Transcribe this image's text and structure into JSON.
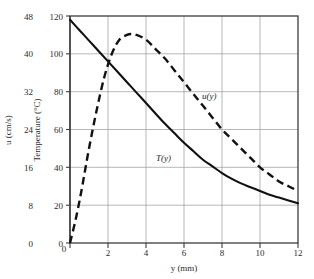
{
  "chart_data": {
    "type": "line",
    "title": "",
    "xlabel": "y (mm)",
    "xlim": [
      0,
      12
    ],
    "xticks": [
      0,
      2,
      4,
      6,
      8,
      10,
      12
    ],
    "grid": true,
    "legend_position": "inline-annotations",
    "axes": [
      {
        "id": "left-outer",
        "label": "u (cm/s)",
        "ylim": [
          0,
          48
        ],
        "yticks": [
          0,
          8,
          16,
          24,
          32,
          40,
          48
        ]
      },
      {
        "id": "left-inner",
        "label": "Temperature (°C)",
        "ylim": [
          0,
          120
        ],
        "yticks": [
          0,
          20,
          40,
          60,
          80,
          100,
          120
        ]
      }
    ],
    "series": [
      {
        "name": "T(y)",
        "annotation": "T(y)",
        "style": "solid",
        "color": "#111111",
        "axis": "left-inner",
        "x": [
          0,
          0.5,
          1,
          1.5,
          2,
          2.5,
          3,
          3.5,
          4,
          4.5,
          5,
          5.5,
          6,
          6.5,
          7,
          7.5,
          8,
          8.5,
          9,
          9.5,
          10,
          10.5,
          11,
          11.5,
          12
        ],
        "values": [
          118,
          112.5,
          107,
          101.5,
          96,
          90.5,
          85,
          79.5,
          74,
          68.5,
          63,
          58,
          53,
          48.5,
          44,
          40.5,
          37,
          34,
          31.5,
          29.5,
          27.5,
          25.5,
          24,
          22.5,
          21
        ]
      },
      {
        "name": "u(y)",
        "annotation": "u(y)",
        "style": "dashed",
        "color": "#111111",
        "axis": "left-outer",
        "x": [
          0,
          0.3,
          0.6,
          1,
          1.4,
          1.8,
          2.2,
          2.6,
          3,
          3.2,
          3.5,
          4,
          4.5,
          5,
          5.5,
          6,
          6.5,
          7,
          7.5,
          8,
          8.5,
          9,
          9.5,
          10,
          10.5,
          11,
          11.5,
          12
        ],
        "values": [
          0,
          5,
          11,
          20,
          28,
          35,
          40,
          43,
          44,
          44.2,
          44,
          43,
          41,
          39,
          36.5,
          34,
          31.5,
          29,
          26.5,
          24,
          22,
          20,
          18,
          16,
          14.5,
          13,
          12,
          11
        ]
      }
    ]
  },
  "annotations": {
    "u_label": "u(y)",
    "t_label": "T(y)"
  },
  "colors": {
    "frame": "#3d3d3d",
    "grid": "#9a9a9a",
    "curve": "#111111",
    "text": "#2b2b2b",
    "background": "#ffffff"
  }
}
